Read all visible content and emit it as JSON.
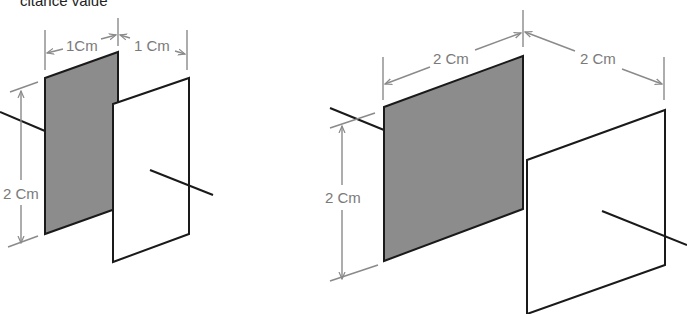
{
  "caption": "citance value",
  "colors": {
    "dark_plate": "#8c8c8c",
    "outline": "#1a1a1a",
    "dimension": "#8a8a8a",
    "background": "#ffffff"
  },
  "figures": [
    {
      "name": "small-capacitor",
      "plate_width_label": "1Cm",
      "plate_gap_label": "1 Cm",
      "plate_height_label": "2 Cm"
    },
    {
      "name": "large-capacitor",
      "plate_width_label": "2 Cm",
      "plate_gap_label": "2 Cm",
      "plate_height_label": "2 Cm"
    }
  ]
}
